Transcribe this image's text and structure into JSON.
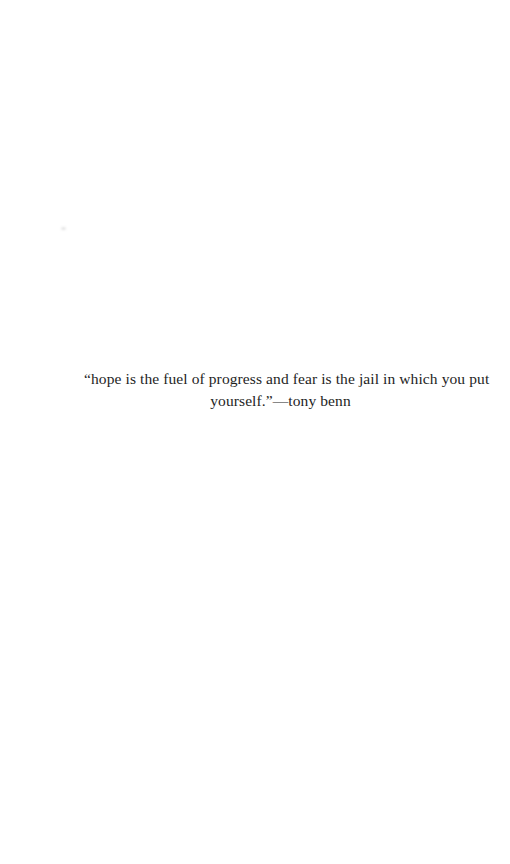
{
  "page": {
    "background": "#ffffff",
    "text_color": "#1e1e1e"
  },
  "quote": {
    "lines": [
      "“hope is the fuel of progress and fear is the jail in which you put",
      "yourself.”—tony benn"
    ]
  }
}
